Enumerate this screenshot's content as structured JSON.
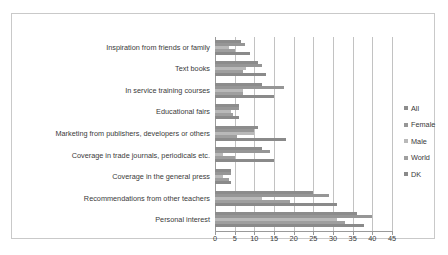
{
  "chart_data": {
    "type": "bar",
    "orientation": "horizontal",
    "title": "",
    "xlabel": "",
    "ylabel": "",
    "xlim": [
      0,
      45
    ],
    "xticks": [
      0,
      5,
      10,
      15,
      20,
      25,
      30,
      35,
      40,
      45
    ],
    "grid": true,
    "legend_position": "right",
    "categories": [
      "Inspiration from friends or family",
      "Text books",
      "In service training courses",
      "Educational fairs",
      "Marketing from publishers, developers or others",
      "Coverage in trade journals, periodicals etc.",
      "Coverage in the general press",
      "Recommendations from other teachers",
      "Personal interest"
    ],
    "series": [
      {
        "name": "All",
        "color": "#8c8c8c",
        "values": [
          6.5,
          11,
          12,
          6,
          11,
          12,
          4,
          25,
          36
        ]
      },
      {
        "name": "Female",
        "color": "#969696",
        "values": [
          7.5,
          12,
          17.5,
          6,
          10,
          14,
          4,
          29,
          40
        ]
      },
      {
        "name": "Male",
        "color": "#b9b9b9",
        "values": [
          3.5,
          8,
          7,
          4,
          10,
          2,
          2,
          12,
          31
        ]
      },
      {
        "name": "World",
        "color": "#9f9f9f",
        "values": [
          5,
          7,
          7,
          4.5,
          5.5,
          5,
          3.5,
          19,
          33
        ]
      },
      {
        "name": "DK",
        "color": "#8a8a8a",
        "values": [
          9,
          13,
          15,
          6,
          18,
          15,
          4,
          31,
          38
        ]
      }
    ]
  },
  "legend": {
    "items": [
      {
        "label": "All"
      },
      {
        "label": "Female"
      },
      {
        "label": "Male"
      },
      {
        "label": "World"
      },
      {
        "label": "DK"
      }
    ]
  }
}
